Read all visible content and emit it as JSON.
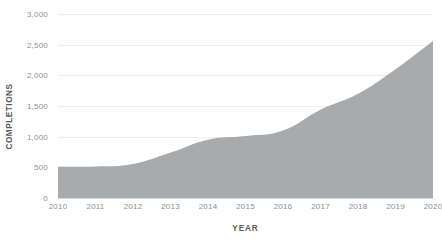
{
  "chart_data": {
    "type": "area",
    "title": "",
    "subtitle": "",
    "xlabel": "YEAR",
    "ylabel": "COMPLETIONS",
    "categories": [
      "2010",
      "2011",
      "2012",
      "2013",
      "2014",
      "2015",
      "2016",
      "2017",
      "2018",
      "2019",
      "2020"
    ],
    "x": [
      2010,
      2011,
      2012,
      2013,
      2014,
      2015,
      2016,
      2017,
      2018,
      2019,
      2020
    ],
    "values": [
      510,
      515,
      555,
      740,
      950,
      1010,
      1100,
      1440,
      1700,
      2100,
      2560
    ],
    "series": [
      {
        "name": "Completions",
        "values": [
          510,
          515,
          555,
          740,
          950,
          1010,
          1100,
          1440,
          1700,
          2100,
          2560
        ]
      }
    ],
    "ylim": [
      0,
      3000
    ],
    "xlim": [
      2010,
      2020
    ],
    "y_ticks": [
      0,
      500,
      1000,
      1500,
      2000,
      2500,
      3000
    ],
    "y_tick_labels": [
      "0",
      "500",
      "1,000",
      "1,500",
      "2,000",
      "2,500",
      "3,000"
    ],
    "x_tick_labels": [
      "2010",
      "2011",
      "2012",
      "2013",
      "2014",
      "2015",
      "2016",
      "2017",
      "2018",
      "2019",
      "2020"
    ],
    "grid": true,
    "grid_axis": "y",
    "legend": false,
    "legend_position": "none",
    "annotations": [],
    "colors": {
      "area_fill": "#a9aaab",
      "gridline": "#eceded",
      "baseline": "#d8d9da",
      "tick_label": "#8d8f91",
      "axis_title": "#595959",
      "background": "#ffffff"
    }
  }
}
